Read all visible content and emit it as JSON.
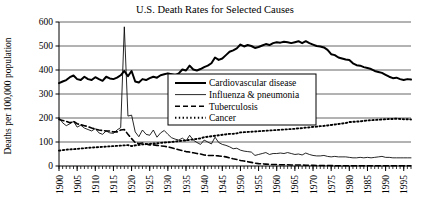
{
  "chart_data": {
    "type": "line",
    "title": "U.S. Death Rates for Selected Causes",
    "xlabel": "",
    "ylabel": "Deaths per 100,000 population",
    "xlim": [
      1900,
      1997
    ],
    "ylim": [
      0,
      600
    ],
    "ytick_labels": [
      "0",
      "100",
      "200",
      "300",
      "400",
      "500",
      "600"
    ],
    "ytick_values": [
      0,
      100,
      200,
      300,
      400,
      500,
      600
    ],
    "xtick_labels": [
      "1900",
      "1905",
      "1910",
      "1915",
      "1920",
      "1925",
      "1930",
      "1935",
      "1940",
      "1945",
      "1950",
      "1955",
      "1960",
      "1965",
      "1970",
      "1975",
      "1980",
      "1985",
      "1990",
      "1995"
    ],
    "xtick_values": [
      1900,
      1905,
      1910,
      1915,
      1920,
      1925,
      1930,
      1935,
      1940,
      1945,
      1950,
      1955,
      1960,
      1965,
      1970,
      1975,
      1980,
      1985,
      1990,
      1995
    ],
    "minor_xtick_step": 1,
    "grid": "horizontal",
    "legend_position": "center",
    "series": [
      {
        "name": "Cardiovascular disease",
        "style": "solid-thick",
        "color": "#000000",
        "x": [
          1900,
          1901,
          1902,
          1903,
          1904,
          1905,
          1906,
          1907,
          1908,
          1909,
          1910,
          1911,
          1912,
          1913,
          1914,
          1915,
          1916,
          1917,
          1918,
          1919,
          1920,
          1921,
          1922,
          1923,
          1924,
          1925,
          1926,
          1927,
          1928,
          1929,
          1930,
          1931,
          1932,
          1933,
          1934,
          1935,
          1936,
          1937,
          1938,
          1939,
          1940,
          1941,
          1942,
          1943,
          1944,
          1945,
          1946,
          1947,
          1948,
          1949,
          1950,
          1951,
          1952,
          1953,
          1954,
          1955,
          1956,
          1957,
          1958,
          1959,
          1960,
          1961,
          1962,
          1963,
          1964,
          1965,
          1966,
          1967,
          1968,
          1969,
          1970,
          1971,
          1972,
          1973,
          1974,
          1975,
          1976,
          1977,
          1978,
          1979,
          1980,
          1981,
          1982,
          1983,
          1984,
          1985,
          1986,
          1987,
          1988,
          1989,
          1990,
          1991,
          1992,
          1993,
          1994,
          1995,
          1996,
          1997
        ],
        "y": [
          345,
          352,
          358,
          370,
          377,
          362,
          358,
          372,
          362,
          358,
          370,
          362,
          355,
          372,
          365,
          362,
          368,
          378,
          396,
          374,
          396,
          352,
          348,
          362,
          358,
          366,
          372,
          368,
          378,
          382,
          386,
          382,
          378,
          386,
          402,
          398,
          418,
          402,
          398,
          404,
          412,
          418,
          428,
          452,
          442,
          448,
          462,
          476,
          482,
          490,
          506,
          498,
          504,
          500,
          492,
          496,
          502,
          508,
          504,
          512,
          516,
          514,
          518,
          516,
          512,
          516,
          520,
          512,
          520,
          512,
          506,
          500,
          498,
          494,
          484,
          466,
          462,
          452,
          448,
          444,
          442,
          428,
          420,
          418,
          412,
          408,
          404,
          396,
          392,
          388,
          380,
          372,
          366,
          368,
          362,
          358,
          362,
          360
        ]
      },
      {
        "name": "Influenza & pneumonia",
        "style": "solid-thin",
        "color": "#000000",
        "x": [
          1900,
          1901,
          1902,
          1903,
          1904,
          1905,
          1906,
          1907,
          1908,
          1909,
          1910,
          1911,
          1912,
          1913,
          1914,
          1915,
          1916,
          1917,
          1918,
          1919,
          1920,
          1921,
          1922,
          1923,
          1924,
          1925,
          1926,
          1927,
          1928,
          1929,
          1930,
          1931,
          1932,
          1933,
          1934,
          1935,
          1936,
          1937,
          1938,
          1939,
          1940,
          1941,
          1942,
          1943,
          1944,
          1945,
          1946,
          1947,
          1948,
          1949,
          1950,
          1951,
          1952,
          1953,
          1954,
          1955,
          1956,
          1957,
          1958,
          1959,
          1960,
          1961,
          1962,
          1963,
          1964,
          1965,
          1966,
          1967,
          1968,
          1969,
          1970,
          1971,
          1972,
          1973,
          1974,
          1975,
          1976,
          1977,
          1978,
          1979,
          1980,
          1981,
          1982,
          1983,
          1984,
          1985,
          1986,
          1987,
          1988,
          1989,
          1990,
          1991,
          1992,
          1993,
          1994,
          1995,
          1996,
          1997
        ],
        "y": [
          202,
          180,
          168,
          176,
          186,
          162,
          170,
          158,
          152,
          146,
          156,
          138,
          132,
          146,
          138,
          136,
          150,
          160,
          580,
          208,
          212,
          142,
          122,
          150,
          132,
          128,
          150,
          120,
          138,
          148,
          132,
          118,
          112,
          108,
          116,
          104,
          128,
          108,
          98,
          90,
          108,
          100,
          92,
          120,
          98,
          90,
          86,
          80,
          72,
          74,
          66,
          62,
          60,
          58,
          44,
          48,
          52,
          56,
          48,
          52,
          52,
          54,
          52,
          56,
          52,
          48,
          50,
          46,
          54,
          48,
          44,
          42,
          42,
          44,
          40,
          38,
          40,
          38,
          38,
          38,
          36,
          34,
          34,
          36,
          34,
          36,
          34,
          36,
          38,
          40,
          36,
          36,
          34,
          34,
          34,
          34,
          34,
          34
        ]
      },
      {
        "name": "Tuberculosis",
        "style": "dashed",
        "color": "#000000",
        "x": [
          1900,
          1901,
          1902,
          1903,
          1904,
          1905,
          1906,
          1907,
          1908,
          1909,
          1910,
          1911,
          1912,
          1913,
          1914,
          1915,
          1916,
          1917,
          1918,
          1919,
          1920,
          1921,
          1922,
          1923,
          1924,
          1925,
          1926,
          1927,
          1928,
          1929,
          1930,
          1931,
          1932,
          1933,
          1934,
          1935,
          1936,
          1937,
          1938,
          1939,
          1940,
          1941,
          1942,
          1943,
          1944,
          1945,
          1946,
          1947,
          1948,
          1949,
          1950,
          1951,
          1952,
          1953,
          1954,
          1955,
          1956,
          1957,
          1958,
          1959,
          1960,
          1961,
          1962,
          1963,
          1964,
          1965,
          1966,
          1967,
          1968,
          1969,
          1970,
          1971,
          1972,
          1973,
          1974,
          1975,
          1976,
          1977,
          1978,
          1979,
          1980,
          1981,
          1982,
          1983,
          1984,
          1985,
          1986,
          1987,
          1988,
          1989,
          1990,
          1991,
          1992,
          1993,
          1994,
          1995,
          1996,
          1997
        ],
        "y": [
          194,
          190,
          186,
          180,
          186,
          176,
          172,
          168,
          164,
          158,
          154,
          150,
          148,
          146,
          146,
          142,
          142,
          150,
          152,
          132,
          114,
          98,
          94,
          96,
          92,
          88,
          88,
          86,
          84,
          82,
          80,
          76,
          72,
          68,
          64,
          60,
          58,
          55,
          52,
          50,
          46,
          44,
          44,
          43,
          42,
          40,
          38,
          34,
          30,
          27,
          23,
          21,
          18,
          15,
          12,
          10,
          9,
          8,
          7,
          6,
          6,
          5,
          5,
          5,
          4,
          4,
          4,
          4,
          3,
          3,
          3,
          2,
          2,
          2,
          2,
          2,
          1,
          1,
          1,
          1,
          1,
          1,
          1,
          1,
          1,
          1,
          1,
          1,
          1,
          1,
          1,
          1,
          1,
          1,
          1,
          1,
          1,
          1
        ]
      },
      {
        "name": "Cancer",
        "style": "dotted",
        "color": "#000000",
        "x": [
          1900,
          1901,
          1902,
          1903,
          1904,
          1905,
          1906,
          1907,
          1908,
          1909,
          1910,
          1911,
          1912,
          1913,
          1914,
          1915,
          1916,
          1917,
          1918,
          1919,
          1920,
          1921,
          1922,
          1923,
          1924,
          1925,
          1926,
          1927,
          1928,
          1929,
          1930,
          1931,
          1932,
          1933,
          1934,
          1935,
          1936,
          1937,
          1938,
          1939,
          1940,
          1941,
          1942,
          1943,
          1944,
          1945,
          1946,
          1947,
          1948,
          1949,
          1950,
          1951,
          1952,
          1953,
          1954,
          1955,
          1956,
          1957,
          1958,
          1959,
          1960,
          1961,
          1962,
          1963,
          1964,
          1965,
          1966,
          1967,
          1968,
          1969,
          1970,
          1971,
          1972,
          1973,
          1974,
          1975,
          1976,
          1977,
          1978,
          1979,
          1980,
          1981,
          1982,
          1983,
          1984,
          1985,
          1986,
          1987,
          1988,
          1989,
          1990,
          1991,
          1992,
          1993,
          1994,
          1995,
          1996,
          1997
        ],
        "y": [
          64,
          66,
          68,
          69,
          70,
          71,
          73,
          74,
          76,
          77,
          78,
          79,
          80,
          81,
          82,
          83,
          84,
          85,
          86,
          87,
          83,
          86,
          88,
          90,
          91,
          92,
          94,
          95,
          96,
          98,
          99,
          100,
          102,
          104,
          105,
          107,
          109,
          111,
          113,
          115,
          120,
          122,
          124,
          126,
          128,
          130,
          132,
          134,
          134,
          136,
          140,
          141,
          142,
          143,
          144,
          145,
          146,
          147,
          148,
          149,
          150,
          151,
          152,
          153,
          154,
          155,
          157,
          158,
          160,
          161,
          163,
          164,
          166,
          167,
          169,
          171,
          173,
          175,
          177,
          179,
          183,
          184,
          185,
          186,
          188,
          190,
          191,
          192,
          193,
          194,
          195,
          196,
          196,
          197,
          196,
          195,
          195,
          194
        ]
      }
    ]
  },
  "legend": {
    "items": [
      {
        "label": "Cardiovascular disease",
        "style": "solid-thick"
      },
      {
        "label": "Influenza & pneumonia",
        "style": "solid-thin"
      },
      {
        "label": "Tuberculosis",
        "style": "dashed"
      },
      {
        "label": "Cancer",
        "style": "dotted"
      }
    ]
  }
}
